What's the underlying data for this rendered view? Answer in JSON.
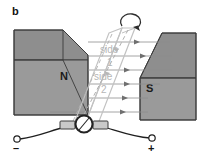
{
  "figure": {
    "panel_label": "b",
    "caption_kind": "electric-motor-current-loop-in-magnetic-field",
    "background_color": "#ffffff"
  },
  "magnets": {
    "left": {
      "pole_label": "N",
      "face_color": "#9a9a9a",
      "top_color": "#8e8e8e",
      "edge_color": "#3a3a3a"
    },
    "right": {
      "pole_label": "S",
      "face_color": "#9a9a9a",
      "top_color": "#8e8e8e",
      "edge_color": "#3a3a3a"
    }
  },
  "field": {
    "line_color": "#8d8d8d",
    "arrow_color": "#6f6f6f",
    "line_count": 6,
    "direction": "left-to-right"
  },
  "loop": {
    "outline_color": "#c2c2c2",
    "hidden_edge_color": "#b0b0b0",
    "labels": [
      {
        "text": "side",
        "number": "1"
      },
      {
        "text": "side",
        "number": "2"
      }
    ]
  },
  "rotation": {
    "arrow_color": "#2b2b2b",
    "direction": "clockwise"
  },
  "circuit": {
    "wire_color": "#1f1f1f",
    "brush_color": "#c9c9c9",
    "brush_edge_color": "#3d3d3d",
    "commutator_color": "#ffffff",
    "commutator_edge_color": "#232323",
    "terminals": [
      {
        "id": "negative",
        "symbol": "–"
      },
      {
        "id": "positive",
        "symbol": "+"
      }
    ]
  }
}
